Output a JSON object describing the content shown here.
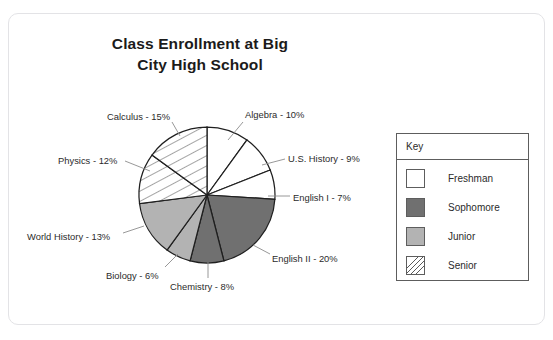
{
  "card": {
    "background": "#ffffff",
    "border_color": "#e3e3e6"
  },
  "title": {
    "line1": "Class Enrollment at Big",
    "line2": "City High School"
  },
  "legend": {
    "title": "Key",
    "items": [
      {
        "label": "Freshman",
        "fill": "#ffffff",
        "pattern": "solid"
      },
      {
        "label": "Sophomore",
        "fill": "#707070",
        "pattern": "solid"
      },
      {
        "label": "Junior",
        "fill": "#b3b3b3",
        "pattern": "solid"
      },
      {
        "label": "Senior",
        "fill": "#ffffff",
        "pattern": "diagonal-hatch"
      }
    ]
  },
  "chart_data": {
    "type": "pie",
    "title": "Class Enrollment at Big City High School",
    "xlabel": "",
    "ylabel": "",
    "units": "percent",
    "total": 100,
    "start_angle_deg": 0,
    "direction": "clockwise",
    "center": {
      "x": 207,
      "y": 195
    },
    "radius": 68,
    "legend_position": "right",
    "grid": false,
    "categories": [
      "Algebra",
      "U.S. History",
      "English I",
      "English II",
      "Chemistry",
      "Biology",
      "World History",
      "Physics",
      "Calculus"
    ],
    "values": [
      10,
      9,
      7,
      20,
      8,
      6,
      13,
      12,
      15
    ],
    "slices": [
      {
        "name": "Algebra",
        "value": 10,
        "label": "Algebra - 10%",
        "group": "Freshman",
        "fill": "#ffffff",
        "pattern": "solid",
        "start_deg": 0,
        "end_deg": 36,
        "label_x": 245,
        "label_y": 109,
        "leader": {
          "x1": 243,
          "y1": 122,
          "x2": 228,
          "y2": 140
        }
      },
      {
        "name": "U.S. History",
        "value": 9,
        "label": "U.S. History - 9%",
        "group": "Freshman",
        "fill": "#ffffff",
        "pattern": "solid",
        "start_deg": 36,
        "end_deg": 68.4,
        "label_x": 288,
        "label_y": 153,
        "leader": {
          "x1": 285,
          "y1": 159,
          "x2": 262,
          "y2": 165
        }
      },
      {
        "name": "English I",
        "value": 7,
        "label": "English I - 7%",
        "group": "Freshman",
        "fill": "#ffffff",
        "pattern": "solid",
        "start_deg": 68.4,
        "end_deg": 93.6,
        "label_x": 293,
        "label_y": 192,
        "leader": {
          "x1": 290,
          "y1": 196,
          "x2": 268,
          "y2": 196
        }
      },
      {
        "name": "English II",
        "value": 20,
        "label": "English II - 20%",
        "group": "Sophomore",
        "fill": "#707070",
        "pattern": "solid",
        "start_deg": 93.6,
        "end_deg": 165.6,
        "label_x": 272,
        "label_y": 253,
        "leader": {
          "x1": 270,
          "y1": 254,
          "x2": 253,
          "y2": 245
        }
      },
      {
        "name": "Chemistry",
        "value": 8,
        "label": "Chemistry - 8%",
        "group": "Sophomore",
        "fill": "#707070",
        "pattern": "solid",
        "start_deg": 165.6,
        "end_deg": 194.4,
        "label_x": 170,
        "label_y": 281,
        "leader": {
          "x1": 208,
          "y1": 278,
          "x2": 208,
          "y2": 262
        }
      },
      {
        "name": "Biology",
        "value": 6,
        "label": "Biology - 6%",
        "group": "Junior",
        "fill": "#b3b3b3",
        "pattern": "solid",
        "start_deg": 194.4,
        "end_deg": 216,
        "label_x": 106,
        "label_y": 270,
        "leader": {
          "x1": 165,
          "y1": 267,
          "x2": 178,
          "y2": 254
        }
      },
      {
        "name": "World History",
        "value": 13,
        "label": "World History - 13%",
        "group": "Junior",
        "fill": "#b3b3b3",
        "pattern": "solid",
        "start_deg": 216,
        "end_deg": 262.8,
        "label_x": 27,
        "label_y": 231,
        "leader": {
          "x1": 123,
          "y1": 233,
          "x2": 144,
          "y2": 226
        }
      },
      {
        "name": "Physics",
        "value": 12,
        "label": "Physics - 12%",
        "group": "Senior",
        "fill": "#ffffff",
        "pattern": "diagonal-hatch",
        "start_deg": 262.8,
        "end_deg": 306,
        "label_x": 58,
        "label_y": 155,
        "leader": {
          "x1": 125,
          "y1": 161,
          "x2": 150,
          "y2": 171
        }
      },
      {
        "name": "Calculus",
        "value": 15,
        "label": "Calculus - 15%",
        "group": "Senior",
        "fill": "#ffffff",
        "pattern": "diagonal-hatch",
        "start_deg": 306,
        "end_deg": 360,
        "label_x": 107,
        "label_y": 111,
        "leader": {
          "x1": 172,
          "y1": 122,
          "x2": 180,
          "y2": 136
        }
      }
    ]
  }
}
